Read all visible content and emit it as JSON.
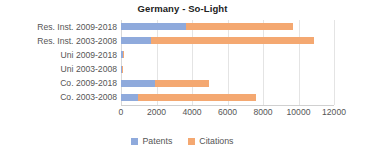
{
  "chart_data": {
    "type": "bar",
    "orientation": "horizontal",
    "stacked": true,
    "title": "Germany - So-Light",
    "xlabel": "",
    "ylabel": "",
    "xlim": [
      0,
      12000
    ],
    "grid": true,
    "legend_position": "bottom",
    "categories": [
      "Res. Inst. 2009-2018",
      "Res. Inst. 2003-2008",
      "Uni 2009-2018",
      "Uni 2003-2008",
      "Co. 2009-2018",
      "Co. 2003-2008"
    ],
    "xticks": [
      0,
      2000,
      4000,
      6000,
      8000,
      10000,
      12000
    ],
    "xtick_labels": [
      "0",
      "2000",
      "4000",
      "6000",
      "8000",
      "10000",
      "12000"
    ],
    "series": [
      {
        "name": "Patents",
        "color": "#8faadc",
        "values": [
          3660,
          1690,
          110,
          80,
          1915,
          960
        ]
      },
      {
        "name": "Citations",
        "color": "#f4a871",
        "values": [
          6030,
          9180,
          60,
          40,
          3045,
          6645
        ]
      }
    ]
  },
  "legend": {
    "items": [
      {
        "label": "Patents",
        "color": "#8faadc"
      },
      {
        "label": "Citations",
        "color": "#f4a871"
      }
    ]
  },
  "axis": {
    "zero_px": 121,
    "px_per_unit": 0.01775
  }
}
